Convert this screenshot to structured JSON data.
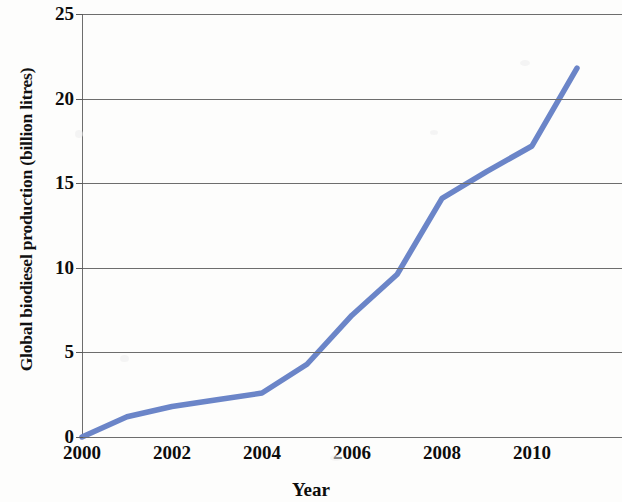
{
  "chart_data": {
    "type": "line",
    "title": "",
    "xlabel": "Year",
    "ylabel": "Global biodiesel production (billion litres)",
    "xlim": [
      2000,
      2012
    ],
    "ylim": [
      0,
      25
    ],
    "grid": true,
    "legend": "none",
    "x_tick_labels": [
      "2000",
      "2002",
      "2004",
      "2006",
      "2008",
      "2010"
    ],
    "x_tick_values": [
      2000,
      2002,
      2004,
      2006,
      2008,
      2010
    ],
    "y_tick_labels": [
      "0",
      "5",
      "10",
      "15",
      "20",
      "25"
    ],
    "y_tick_values": [
      0,
      5,
      10,
      15,
      20,
      25
    ],
    "series": [
      {
        "name": "Global biodiesel production",
        "color": "#6b85c8",
        "x": [
          2000,
          2001,
          2002,
          2003,
          2004,
          2005,
          2006,
          2007,
          2008,
          2009,
          2010,
          2011
        ],
        "values": [
          0,
          1.2,
          1.8,
          2.2,
          2.6,
          4.3,
          7.2,
          9.6,
          14.1,
          15.7,
          17.2,
          21.8
        ]
      }
    ]
  },
  "axes": {
    "y_title": "Global biodiesel production (billion litres)",
    "x_title": "Year"
  },
  "colors": {
    "series_line": "#6b85c8",
    "gridline": "#6d6d6d",
    "text": "#0d0d0d",
    "background": "#fdfdfc"
  }
}
